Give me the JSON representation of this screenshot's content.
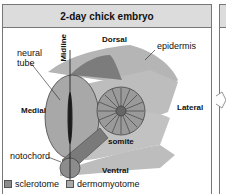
{
  "title": "2-day chick embryo",
  "labels": {
    "midline": "Midline",
    "dorsal": "Dorsal",
    "epidermis": "epidermis",
    "neural_tube": "neural tube",
    "neural_tube_line1": "neural",
    "neural_tube_line2": "tube",
    "medial": "Medial",
    "lateral": "Lateral",
    "somite": "somite",
    "notochord": "notochord",
    "ventral": "Ventral"
  },
  "legend": [
    {
      "label": "sclerotome",
      "color": "#8c8c8c"
    },
    {
      "label": "dermomyotome",
      "color": "#a9a9a9"
    }
  ],
  "colors": {
    "header_bg": "#dcdcdc",
    "tissue_light": "#b8b8b8",
    "neural_tube": "#a6a6a6",
    "dark": "#555555"
  }
}
